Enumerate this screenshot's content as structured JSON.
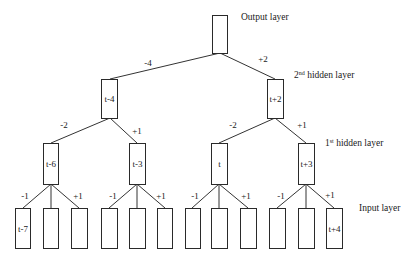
{
  "diagram": {
    "type": "tree",
    "layers": {
      "output": "Output layer",
      "hidden2_num": "2",
      "hidden2_sup": "nd",
      "hidden2_rest": " hidden layer",
      "hidden1_num": "1",
      "hidden1_sup": "st",
      "hidden1_rest": " hidden layer",
      "input": "Input layer"
    },
    "nodes": {
      "output": "",
      "h2_left": "t-4",
      "h2_right": "t+2",
      "h1": [
        "t-6",
        "t-3",
        "t",
        "t+3"
      ],
      "input": [
        "t-7",
        "",
        "",
        "",
        "",
        "",
        "",
        "",
        "",
        "",
        "",
        "t+4"
      ]
    },
    "edge_labels": {
      "out_left": "-4",
      "out_right": "+2",
      "h2l_left": "-2",
      "h2l_right": "+1",
      "h2r_left": "-2",
      "h2r_right": "+1",
      "h1": [
        {
          "left": "-1",
          "right": "+1"
        },
        {
          "left": "-1",
          "right": "+1"
        },
        {
          "left": "-1",
          "right": "+1"
        },
        {
          "left": "-1",
          "right": "+1"
        }
      ]
    }
  }
}
